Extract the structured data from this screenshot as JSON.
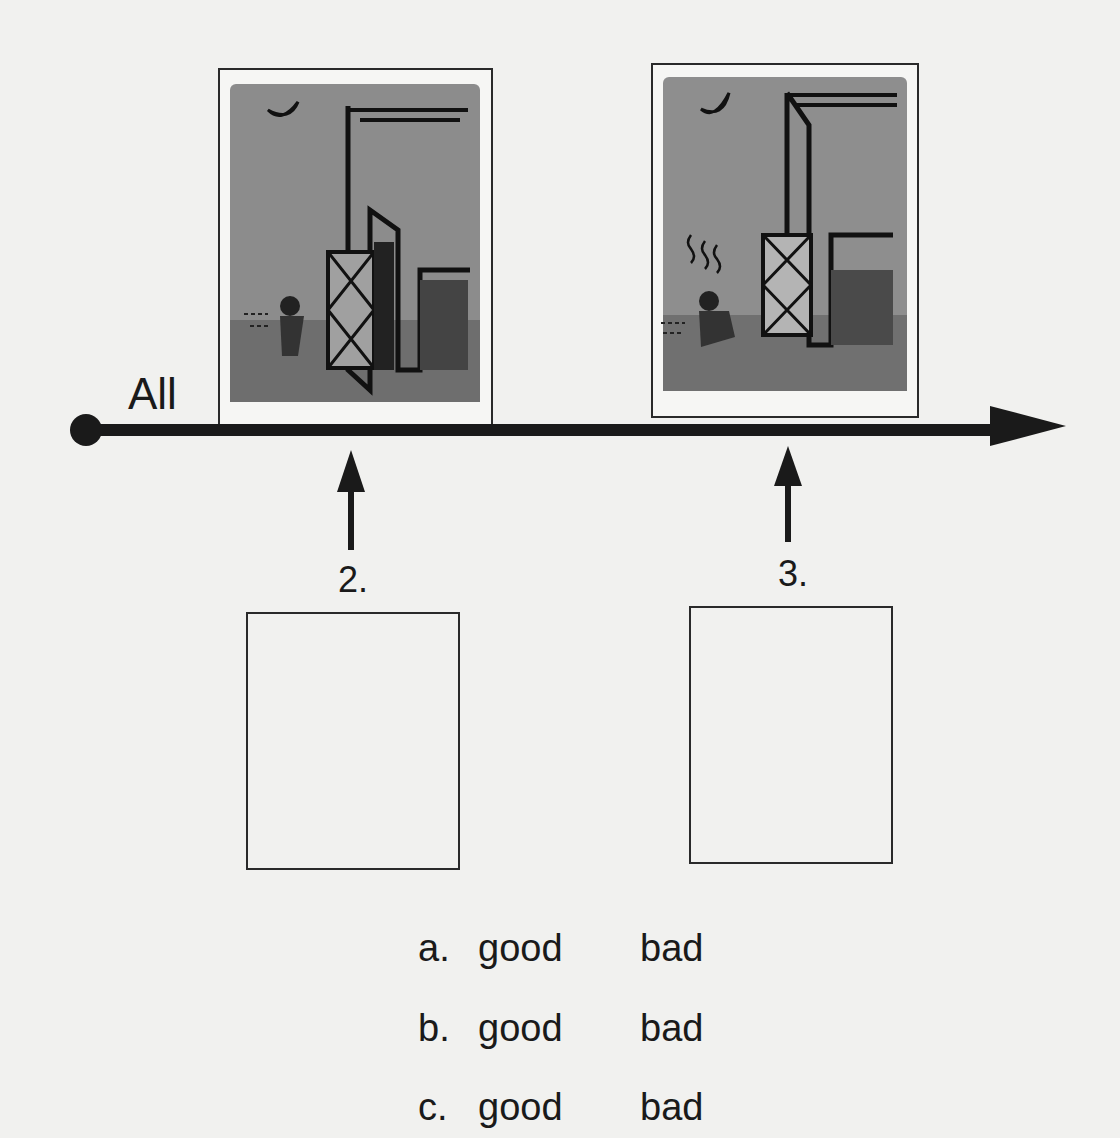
{
  "timeline": {
    "start_label": "All",
    "markers": [
      {
        "number": "2."
      },
      {
        "number": "3."
      }
    ]
  },
  "pictures": [
    {
      "description": "Night scene: moon, barn with door open, figure running toward barn"
    },
    {
      "description": "Night scene: moon, barn with door closed, figure crouched outside with wavy smell lines"
    }
  ],
  "answer_boxes": [
    {
      "for": "2."
    },
    {
      "for": "3."
    }
  ],
  "options": [
    {
      "letter": "a.",
      "good": "good",
      "bad": "bad"
    },
    {
      "letter": "b.",
      "good": "good",
      "bad": "bad"
    },
    {
      "letter": "c.",
      "good": "good",
      "bad": "bad"
    }
  ],
  "colors": {
    "ink": "#1a1a1a",
    "paper": "#f1f1ef",
    "wash": "#8a8a8a"
  }
}
